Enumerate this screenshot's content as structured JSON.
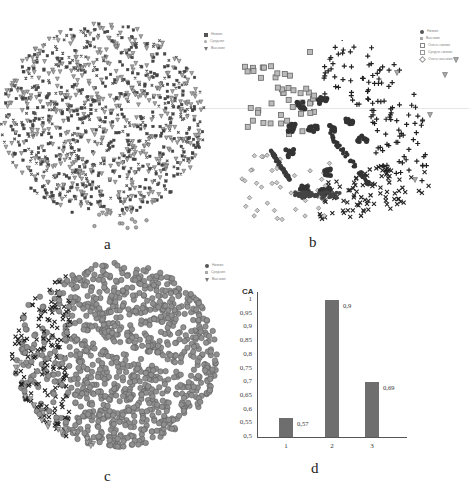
{
  "panels": {
    "a": {
      "label": "a",
      "type": "scatter",
      "legend": [
        "Низкие",
        "Средние",
        "Высокие"
      ]
    },
    "b": {
      "label": "b",
      "type": "scatter",
      "legend": [
        "Низкие",
        "Высокие",
        "Очень низкие",
        "Средне-низкие",
        "Очень высокие"
      ]
    },
    "c": {
      "label": "c",
      "type": "scatter",
      "legend": [
        "Низкие",
        "Средние",
        "Высокие"
      ]
    },
    "d": {
      "label": "d",
      "type": "bar"
    }
  },
  "chart_data": [
    {
      "panel": "a",
      "type": "scatter",
      "title": "",
      "legend": [
        "Низкие",
        "Средние",
        "Высокие"
      ],
      "description": "Dense roughly circular cloud of mixed markers (squares, small crosses, inverted triangles) with no clear class separation",
      "legend_position": "top-right"
    },
    {
      "panel": "b",
      "type": "scatter",
      "title": "",
      "legend": [
        "Низкие",
        "Высокие",
        "Очень низкие",
        "Средне-низкие",
        "Очень высокие"
      ],
      "description": "Spiral-like arrangement: squares upper-left, plus signs upper-right, x markers lower-right, diamonds lower-left, large dark blobs in center arcs, few triangles far right",
      "legend_position": "top-right"
    },
    {
      "panel": "c",
      "type": "scatter",
      "title": "",
      "legend": [
        "Низкие",
        "Средние",
        "Высокие"
      ],
      "description": "Dense circular cloud of gray circles split by a diagonal gap, x markers concentrated on the left edge, inverted triangles along lower-left boundary",
      "legend_position": "top-right"
    },
    {
      "panel": "d",
      "type": "bar",
      "title": "",
      "categories": [
        "1",
        "2",
        "3"
      ],
      "values": [
        0.57,
        1.0,
        0.7
      ],
      "data_labels": [
        "0,57",
        "0,9",
        "0,69"
      ],
      "xlabel": "",
      "ylabel": "CA",
      "ylim": [
        0.5,
        1.0
      ],
      "yticks": [
        "0,5",
        "0,55",
        "0,6",
        "0,65",
        "0,7",
        "0,75",
        "0,8",
        "0,85",
        "0,9",
        "0,95",
        "1"
      ],
      "grid": false,
      "bar_color": "#6e6e6e"
    }
  ]
}
